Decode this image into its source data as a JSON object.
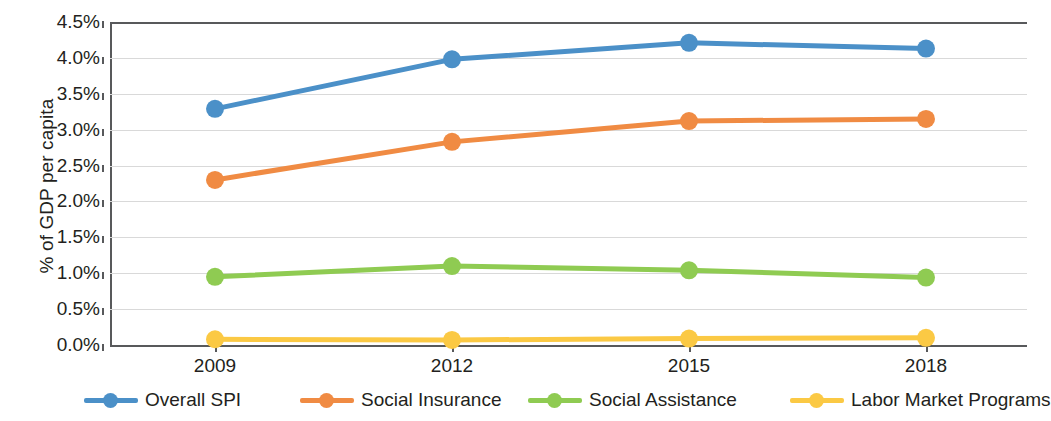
{
  "chart_data": {
    "type": "line",
    "title": "",
    "xlabel": "",
    "ylabel": "% of GDP per capita",
    "x": [
      "2009",
      "2012",
      "2015",
      "2018"
    ],
    "categories": [
      "2009",
      "2012",
      "2015",
      "2018"
    ],
    "ylim": [
      0.0,
      4.5
    ],
    "ytick_labels": [
      "4.5%",
      "4.0%",
      "3.5%",
      "3.0%",
      "2.5%",
      "2.0%",
      "1.5%",
      "1.0%",
      "0.5%",
      "0.0%"
    ],
    "ytick_values": [
      4.5,
      4.0,
      3.5,
      3.0,
      2.5,
      2.0,
      1.5,
      1.0,
      0.5,
      0.0
    ],
    "grid": true,
    "legend_position": "bottom",
    "series": [
      {
        "name": "Overall SPI",
        "color": "#4B90C8",
        "values": [
          3.29,
          3.98,
          4.21,
          4.13
        ]
      },
      {
        "name": "Social Insurance",
        "color": "#F08B43",
        "values": [
          2.3,
          2.83,
          3.12,
          3.15
        ]
      },
      {
        "name": "Social Assistance",
        "color": "#8FCB52",
        "values": [
          0.95,
          1.1,
          1.04,
          0.94
        ]
      },
      {
        "name": "Labor Market Programs",
        "color": "#FBC944",
        "values": [
          0.08,
          0.07,
          0.09,
          0.1
        ]
      }
    ]
  },
  "axis": {
    "y_title": "% of GDP per capita"
  },
  "legend": {
    "items": [
      {
        "label": "Overall SPI",
        "color": "#4B90C8"
      },
      {
        "label": "Social Insurance",
        "color": "#F08B43"
      },
      {
        "label": "Social Assistance",
        "color": "#8FCB52"
      },
      {
        "label": "Labor Market Programs",
        "color": "#FBC944"
      }
    ]
  }
}
